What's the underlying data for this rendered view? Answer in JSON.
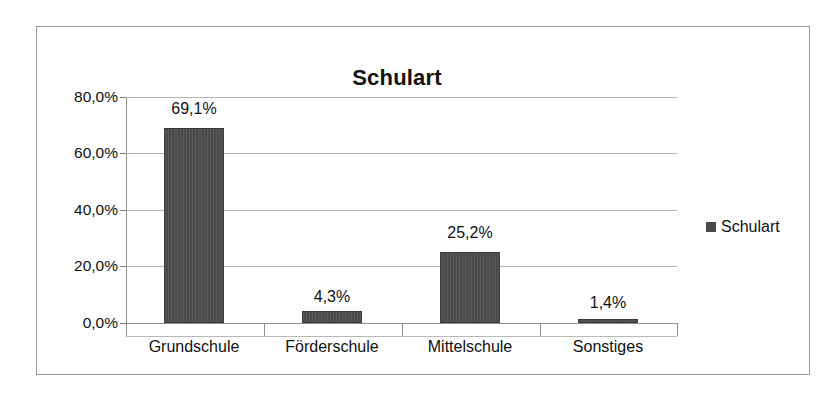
{
  "chart_data": {
    "type": "bar",
    "title": "Schulart",
    "categories": [
      "Grundschule",
      "Förderschule",
      "Mittelschule",
      "Sonstiges"
    ],
    "values": [
      69.1,
      4.3,
      25.2,
      1.4
    ],
    "value_labels": [
      "69,1%",
      "4,3%",
      "25,2%",
      "1,4%"
    ],
    "series": [
      {
        "name": "Schulart",
        "values": [
          69.1,
          4.3,
          25.2,
          1.4
        ],
        "color": "#4a4a4a"
      }
    ],
    "xlabel": "",
    "ylabel": "",
    "ylim": [
      0,
      80
    ],
    "ytick_values": [
      0,
      20,
      40,
      60,
      80
    ],
    "ytick_labels": [
      "0,0%",
      "20,0%",
      "40,0%",
      "60,0%",
      "80,0%"
    ],
    "grid": true,
    "legend": {
      "position": "right",
      "entries": [
        {
          "label": "Schulart",
          "color": "#4a4a4a",
          "marker": "square-marker"
        }
      ]
    },
    "axis_color": "#8f8f8f",
    "gridline_color": "#b5b5b5",
    "frame_color": "#9a9a9a",
    "background_color": "#ffffff"
  }
}
